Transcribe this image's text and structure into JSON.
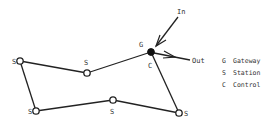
{
  "diagram": {
    "nodes": [
      {
        "id": "s1",
        "label": "S",
        "x": 20,
        "y": 61,
        "type": "station",
        "label_pos": "left"
      },
      {
        "id": "s2",
        "label": "S",
        "x": 87,
        "y": 73,
        "type": "station",
        "label_pos": "above"
      },
      {
        "id": "g",
        "label": "G",
        "x": 151,
        "y": 52,
        "type": "gateway",
        "label_pos": "above-left"
      },
      {
        "id": "s3",
        "label": "S",
        "x": 179,
        "y": 113,
        "type": "station",
        "label_pos": "right"
      },
      {
        "id": "s4",
        "label": "S",
        "x": 113,
        "y": 100,
        "type": "station",
        "label_pos": "below"
      },
      {
        "id": "s5",
        "label": "S",
        "x": 36,
        "y": 111,
        "type": "station",
        "label_pos": "left"
      }
    ],
    "control_label": "C",
    "edges": [
      [
        "s1",
        "s2"
      ],
      [
        "s2",
        "g"
      ],
      [
        "g",
        "s3"
      ],
      [
        "s3",
        "s4"
      ],
      [
        "s4",
        "s5"
      ],
      [
        "s5",
        "s1"
      ]
    ],
    "in_label": "In",
    "out_label": "Out",
    "legend": [
      {
        "key": "G",
        "text": "Gateway"
      },
      {
        "key": "S",
        "text": "Station"
      },
      {
        "key": "C",
        "text": "Control"
      }
    ]
  }
}
